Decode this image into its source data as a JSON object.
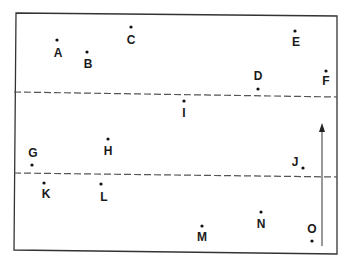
{
  "diagram": {
    "frame": {
      "x1": 16,
      "y1": 13,
      "x2": 337,
      "y2": 254,
      "stroke": "#333333"
    },
    "dashed_lines": [
      {
        "name": "upper-boundary",
        "y1": 92,
        "y2": 97
      },
      {
        "name": "lower-boundary",
        "y1": 173,
        "y2": 177
      }
    ],
    "arrow": {
      "x": 322,
      "y_start": 246,
      "y_end": 123,
      "direction": "up"
    },
    "points": [
      {
        "label": "A",
        "dot": [
          57,
          40
        ],
        "text": [
          58,
          57
        ]
      },
      {
        "label": "B",
        "dot": [
          87,
          52
        ],
        "text": [
          88,
          68
        ]
      },
      {
        "label": "C",
        "dot": [
          131,
          27
        ],
        "text": [
          131,
          44
        ]
      },
      {
        "label": "D",
        "dot": [
          258,
          89
        ],
        "text": [
          258,
          80
        ]
      },
      {
        "label": "E",
        "dot": [
          295,
          31
        ],
        "text": [
          296,
          46
        ]
      },
      {
        "label": "F",
        "dot": [
          326,
          71
        ],
        "text": [
          326,
          85
        ]
      },
      {
        "label": "G",
        "dot": [
          32,
          165
        ],
        "text": [
          33,
          157
        ]
      },
      {
        "label": "H",
        "dot": [
          108,
          139
        ],
        "text": [
          108,
          155
        ]
      },
      {
        "label": "I",
        "dot": [
          184,
          101
        ],
        "text": [
          184,
          117
        ]
      },
      {
        "label": "J",
        "dot": [
          303,
          168
        ],
        "text": [
          295,
          166
        ]
      },
      {
        "label": "K",
        "dot": [
          44,
          183
        ],
        "text": [
          46,
          198
        ]
      },
      {
        "label": "L",
        "dot": [
          101,
          184
        ],
        "text": [
          104,
          201
        ]
      },
      {
        "label": "M",
        "dot": [
          202,
          226
        ],
        "text": [
          202,
          241
        ]
      },
      {
        "label": "N",
        "dot": [
          261,
          212
        ],
        "text": [
          261,
          228
        ]
      },
      {
        "label": "O",
        "dot": [
          312,
          241
        ],
        "text": [
          312,
          233
        ]
      }
    ]
  }
}
